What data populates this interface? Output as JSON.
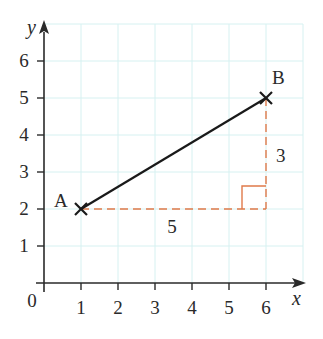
{
  "diagram": {
    "title": "",
    "origin_label": "0",
    "axes": {
      "x": {
        "name": "x",
        "min": 0,
        "max": 7,
        "ticks": [
          "1",
          "2",
          "3",
          "4",
          "5",
          "6"
        ]
      },
      "y": {
        "name": "y",
        "min": 0,
        "max": 7,
        "ticks": [
          "1",
          "2",
          "3",
          "4",
          "5",
          "6"
        ]
      }
    },
    "points": [
      {
        "label": "A",
        "x": 1,
        "y": 2
      },
      {
        "label": "B",
        "x": 6,
        "y": 5
      }
    ],
    "segment": {
      "from": "A",
      "to": "B",
      "color": "#1a1a1a"
    },
    "right_triangle": {
      "horizontal_leg": {
        "from": [
          1,
          2
        ],
        "to": [
          6,
          2
        ],
        "label": "5"
      },
      "vertical_leg": {
        "from": [
          6,
          2
        ],
        "to": [
          6,
          5
        ],
        "label": "3"
      },
      "color": "#e07a4a",
      "style": "dashed"
    },
    "colors": {
      "grid": "#d6f1f1",
      "axis": "#2a2a2a",
      "dashed": "#e07a4a",
      "segment": "#1a1a1a"
    }
  }
}
